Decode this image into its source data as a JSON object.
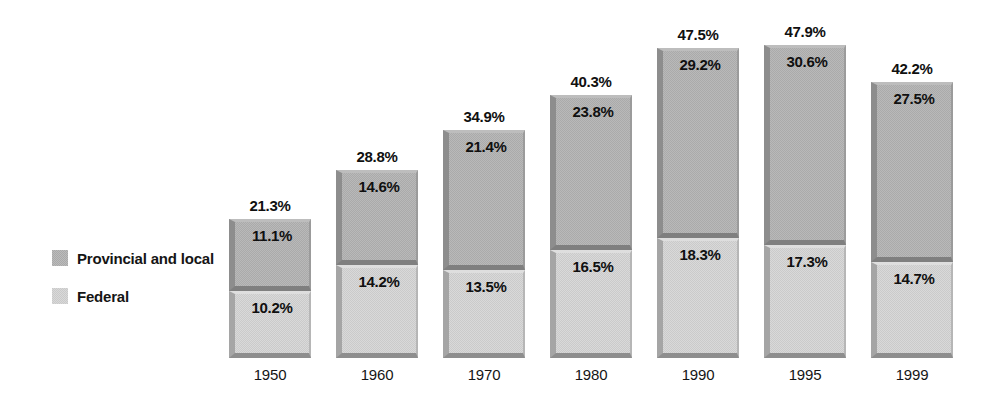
{
  "legend": {
    "items": [
      {
        "label": "Provincial and local",
        "swatch": "provincial-swatch",
        "color": "#a9a9a9"
      },
      {
        "label": "Federal",
        "swatch": "federal-swatch",
        "color": "#c9c9c9"
      }
    ]
  },
  "chart_data": {
    "type": "bar",
    "stacked": true,
    "title": "",
    "subtitle": "",
    "xlabel": "",
    "ylabel": "",
    "grid": false,
    "legend_position": "left",
    "axis_visible": false,
    "ylim": [
      0,
      47.9
    ],
    "categories": [
      "1950",
      "1960",
      "1970",
      "1980",
      "1990",
      "1995",
      "1999"
    ],
    "series": [
      {
        "name": "Provincial and local",
        "color": "#a9a9a9",
        "values": [
          11.1,
          14.6,
          21.4,
          23.8,
          29.2,
          30.6,
          27.5
        ]
      },
      {
        "name": "Federal",
        "color": "#c9c9c9",
        "values": [
          10.2,
          14.2,
          13.5,
          16.5,
          18.3,
          17.3,
          14.7
        ]
      }
    ],
    "totals": [
      21.3,
      28.8,
      34.9,
      40.3,
      47.5,
      47.9,
      42.2
    ],
    "value_labels": {
      "provincial": [
        "11.1%",
        "14.6%",
        "21.4%",
        "23.8%",
        "29.2%",
        "30.6%",
        "27.5%"
      ],
      "federal": [
        "10.2%",
        "14.2%",
        "13.5%",
        "16.5%",
        "18.3%",
        "17.3%",
        "14.7%"
      ],
      "totals": [
        "21.3%",
        "28.8%",
        "34.9%",
        "40.3%",
        "47.5%",
        "47.9%",
        "42.2%"
      ]
    }
  },
  "layout": {
    "baseline_y": 358,
    "px_per_percent": 6.53,
    "first_bar_x": 229,
    "bar_pitch": 107,
    "bar_width": 82,
    "total_label_offset": 22,
    "year_label_offset": 8
  }
}
